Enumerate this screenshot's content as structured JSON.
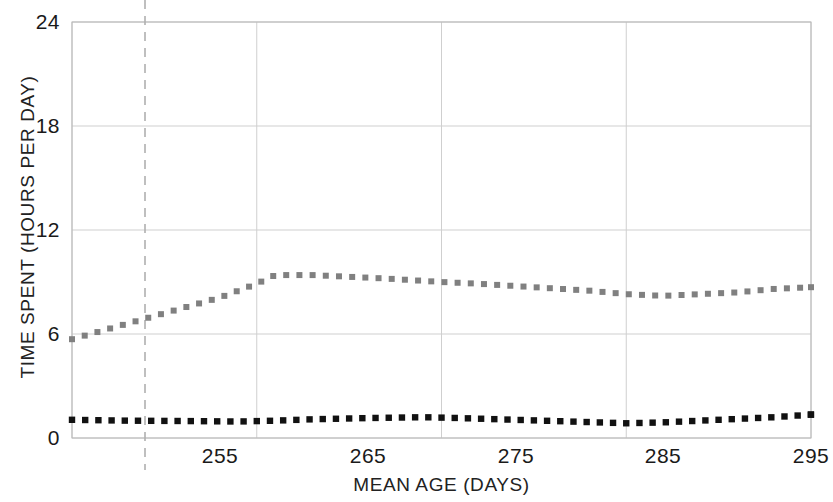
{
  "chart_data": {
    "type": "line",
    "title": "",
    "xlabel": "MEAN AGE (DAYS)",
    "ylabel": "TIME SPENT (HOURS PER DAY)",
    "xlim": [
      255,
      295
    ],
    "ylim": [
      0,
      24
    ],
    "xticks": [
      255,
      265,
      275,
      285,
      295
    ],
    "yticks": [
      0,
      6,
      12,
      18,
      24
    ],
    "grid": true,
    "legend": "none",
    "series": [
      {
        "name": "upper-series",
        "style": "dotted",
        "color": "#808080",
        "x": [
          255,
          257,
          259,
          261,
          263,
          265,
          266,
          268,
          270,
          272,
          275,
          277,
          280,
          283,
          285,
          287,
          289,
          291,
          293,
          295
        ],
        "values": [
          5.7,
          6.3,
          6.9,
          7.5,
          8.1,
          8.9,
          9.4,
          9.4,
          9.3,
          9.2,
          9.0,
          8.9,
          8.7,
          8.5,
          8.3,
          8.2,
          8.3,
          8.4,
          8.6,
          8.7
        ]
      },
      {
        "name": "lower-series",
        "style": "dotted",
        "color": "#111111",
        "x": [
          255,
          258,
          261,
          264,
          266,
          268,
          271,
          274,
          276,
          279,
          282,
          285,
          287,
          289,
          291,
          293,
          295
        ],
        "values": [
          1.05,
          1.0,
          0.98,
          0.95,
          1.0,
          1.08,
          1.15,
          1.2,
          1.15,
          1.05,
          0.95,
          0.85,
          0.9,
          1.0,
          1.1,
          1.2,
          1.35
        ]
      }
    ],
    "reference_line": {
      "name": "vertical-reference-line",
      "orientation": "vertical",
      "x_pixel": 145,
      "style": "dashed",
      "color": "#b0b0b0"
    },
    "axis_tick_labels_x": [
      "255",
      "265",
      "275",
      "285",
      "295"
    ],
    "axis_tick_labels_y": [
      "0",
      "6",
      "12",
      "18",
      "24"
    ]
  },
  "geometry": {
    "plot_left": 72,
    "plot_right": 811,
    "plot_top": 22,
    "plot_bottom": 438
  }
}
